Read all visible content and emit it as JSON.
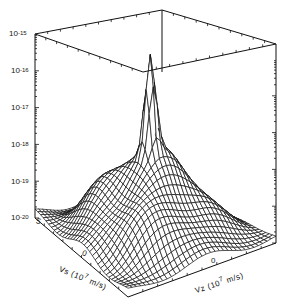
{
  "chart_data": {
    "type": "surface3d",
    "title": "",
    "zlabel": "DISTR. FUNC. (s^3/m^6)",
    "xlabel": "Vs (10^7 m/s)",
    "ylabel": "Vz (10^7 m/s)",
    "z_scale": "log",
    "z_ticks": [
      "10^-15",
      "10^-16",
      "10^-17",
      "10^-18",
      "10^-19",
      "10^-20"
    ],
    "z_tick_exponents": [
      -15,
      -16,
      -17,
      -18,
      -19,
      -20
    ],
    "zlim_exponent": [
      -20,
      -15
    ],
    "x_ticks": [
      "5",
      "0"
    ],
    "y_ticks": [
      "0"
    ],
    "grid": false,
    "peak_log10": -15.4,
    "plateau_log10": -18.3,
    "floor_log10": -20
  },
  "labels": {
    "z_tick_base": "10",
    "z_tick_exps": [
      "-15",
      "-16",
      "-17",
      "-18",
      "-19",
      "-20"
    ],
    "zaxis_title": "DISTR. FUNC. (s",
    "zaxis_sup1": "3",
    "zaxis_mid": "/m",
    "zaxis_sup2": "6",
    "zaxis_end": ")",
    "vs_title": "Vs (10",
    "vs_sup": "7",
    "vs_end": " m/s)",
    "vz_title": "Vz (10",
    "vz_sup": "7",
    "vz_end": " m/s)",
    "vs_tick_5": "5",
    "vs_tick_0": "0",
    "vz_tick_0": "0"
  }
}
